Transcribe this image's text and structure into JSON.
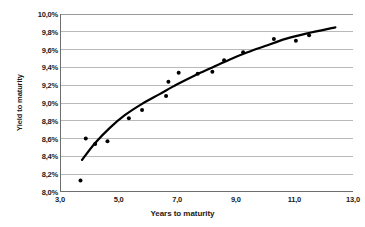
{
  "chart_data": {
    "type": "scatter",
    "title": "",
    "xlabel": "Years to maturity",
    "ylabel": "Yield to maturity",
    "xlim": [
      3.0,
      13.0
    ],
    "ylim": [
      8.0,
      10.0
    ],
    "grid": true,
    "legend": false,
    "decimal_separator": ",",
    "x_tick_labels": [
      "3,0",
      "5,0",
      "7,0",
      "9,0",
      "11,0",
      "13,0"
    ],
    "x_tick_values": [
      3.0,
      5.0,
      7.0,
      9.0,
      11.0,
      13.0
    ],
    "y_tick_labels": [
      "8,0%",
      "8,2%",
      "8,4%",
      "8,6%",
      "8,8%",
      "9,0%",
      "9,2%",
      "9,4%",
      "9,6%",
      "9,8%",
      "10,0%"
    ],
    "y_tick_values": [
      8.0,
      8.2,
      8.4,
      8.6,
      8.8,
      9.0,
      9.2,
      9.4,
      9.6,
      9.8,
      10.0
    ],
    "series": [
      {
        "name": "Observed bonds",
        "marker": "dot",
        "color": "#000000",
        "points": [
          [
            3.7,
            8.13
          ],
          [
            3.88,
            8.6
          ],
          [
            4.2,
            8.54
          ],
          [
            4.62,
            8.57
          ],
          [
            5.35,
            8.83
          ],
          [
            5.8,
            8.92
          ],
          [
            6.62,
            9.08
          ],
          [
            6.7,
            9.24
          ],
          [
            7.05,
            9.34
          ],
          [
            7.7,
            9.33
          ],
          [
            8.2,
            9.35
          ],
          [
            8.6,
            9.48
          ],
          [
            9.25,
            9.57
          ],
          [
            10.3,
            9.72
          ],
          [
            11.05,
            9.7
          ],
          [
            11.5,
            9.76
          ]
        ]
      }
    ],
    "trendline": {
      "name": "Fitted yield curve",
      "color": "#000000",
      "style": "solid",
      "x_start": 3.75,
      "x_end": 12.4,
      "y_start": 8.36,
      "y_end": 9.85,
      "points": [
        [
          3.75,
          8.36
        ],
        [
          4.2,
          8.55
        ],
        [
          4.7,
          8.72
        ],
        [
          5.2,
          8.86
        ],
        [
          5.8,
          8.99
        ],
        [
          6.4,
          9.1
        ],
        [
          7.0,
          9.21
        ],
        [
          7.6,
          9.31
        ],
        [
          8.2,
          9.4
        ],
        [
          8.8,
          9.49
        ],
        [
          9.4,
          9.57
        ],
        [
          10.0,
          9.64
        ],
        [
          10.7,
          9.72
        ],
        [
          11.4,
          9.78
        ],
        [
          12.4,
          9.85
        ]
      ]
    }
  },
  "colors": {
    "grid": "#b9b9b9",
    "axis": "#6e6e6e",
    "marker": "#000000",
    "trend": "#000000",
    "background": "#ffffff",
    "text": "#1a1a1a"
  }
}
